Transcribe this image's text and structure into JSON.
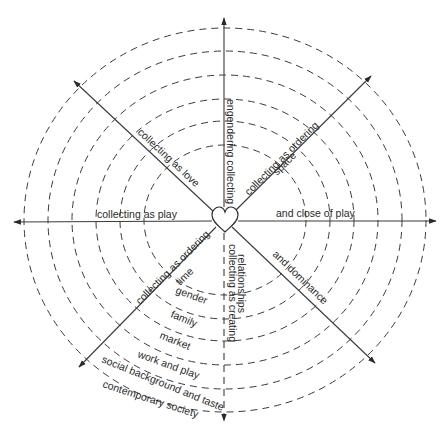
{
  "diagram": {
    "center": "heart",
    "axes": {
      "up": "engendering collecting",
      "upper_right_1": "collecting as ordering",
      "upper_right_2": "space",
      "right": "and close of play",
      "lower_right": "and dominance",
      "down_1": "collecting as creating",
      "down_2": "relationships",
      "lower_left_1": "collecting as ordering",
      "lower_left_2": "time",
      "left": "collecting as play",
      "upper_left": "collecting as love"
    },
    "rings": [
      "gender",
      "family",
      "market",
      "work and play",
      "social background and taste",
      "contemporary society"
    ]
  }
}
